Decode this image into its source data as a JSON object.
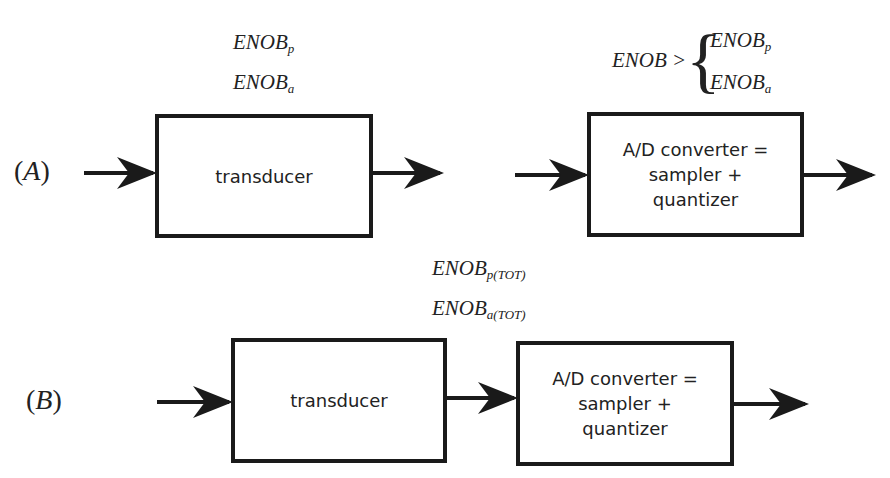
{
  "diagram": {
    "row_a": {
      "label_letter": "A",
      "transducer": {
        "label": "transducer"
      },
      "transducer_specs": [
        {
          "base": "ENOB",
          "sub": "p"
        },
        {
          "base": "ENOB",
          "sub": "a"
        }
      ],
      "adc": {
        "line1": "A/D converter =",
        "line2": "sampler +",
        "line3": "quantizer"
      },
      "adc_condition": {
        "lhs": "ENOB >",
        "cases": [
          {
            "base": "ENOB",
            "sub": "p"
          },
          {
            "base": "ENOB",
            "sub": "a"
          }
        ]
      }
    },
    "row_b": {
      "label_letter": "B",
      "transducer": {
        "label": "transducer"
      },
      "total_specs": [
        {
          "base": "ENOB",
          "sub": "p(TOT)"
        },
        {
          "base": "ENOB",
          "sub": "a(TOT)"
        }
      ],
      "adc": {
        "line1": "A/D converter =",
        "line2": "sampler +",
        "line3": "quantizer"
      }
    },
    "colors": {
      "stroke": "#1a1a1a",
      "text": "#222222",
      "background": "#ffffff"
    }
  }
}
